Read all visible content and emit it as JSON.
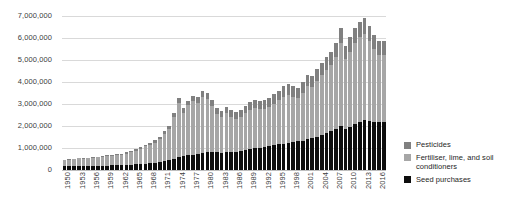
{
  "chart_data": {
    "type": "bar",
    "title": "",
    "subtitle": "",
    "xlabel": "",
    "ylabel": "",
    "stacked": true,
    "grid": true,
    "legend_position": "right",
    "ylim": [
      0,
      7000000
    ],
    "ytick_values": [
      0,
      1000000,
      2000000,
      3000000,
      4000000,
      5000000,
      6000000,
      7000000
    ],
    "ytick_labels": [
      "0",
      "1,000,000",
      "2,000,000",
      "3,000,000",
      "4,000,000",
      "5,000,000",
      "6,000,000",
      "7,000,000"
    ],
    "categories": [
      "1950",
      "1951",
      "1952",
      "1953",
      "1954",
      "1955",
      "1956",
      "1957",
      "1958",
      "1959",
      "1960",
      "1961",
      "1962",
      "1963",
      "1964",
      "1965",
      "1966",
      "1967",
      "1968",
      "1969",
      "1970",
      "1971",
      "1972",
      "1973",
      "1974",
      "1975",
      "1976",
      "1977",
      "1978",
      "1979",
      "1980",
      "1981",
      "1982",
      "1983",
      "1984",
      "1985",
      "1986",
      "1987",
      "1988",
      "1989",
      "1990",
      "1991",
      "1992",
      "1993",
      "1994",
      "1995",
      "1996",
      "1997",
      "1998",
      "1999",
      "2000",
      "2001",
      "2002",
      "2003",
      "2004",
      "2005",
      "2006",
      "2007",
      "2008",
      "2009",
      "2010",
      "2011",
      "2012",
      "2013",
      "2014",
      "2015",
      "2016",
      "2017"
    ],
    "xtick_labels": [
      "1950",
      "1953",
      "1956",
      "1959",
      "1962",
      "1965",
      "1968",
      "1971",
      "1974",
      "1977",
      "1980",
      "1983",
      "1986",
      "1989",
      "1992",
      "1995",
      "1998",
      "2001",
      "2004",
      "2007",
      "2010",
      "2013",
      "2016"
    ],
    "xtick_step": 3,
    "series": [
      {
        "name": "Seed purchases",
        "color": "#0d0d0d",
        "values": [
          160000,
          170000,
          180000,
          185000,
          180000,
          185000,
          190000,
          195000,
          200000,
          205000,
          210000,
          215000,
          225000,
          230000,
          240000,
          255000,
          270000,
          290000,
          310000,
          330000,
          360000,
          400000,
          450000,
          520000,
          600000,
          640000,
          660000,
          690000,
          720000,
          760000,
          800000,
          820000,
          800000,
          790000,
          800000,
          820000,
          840000,
          860000,
          900000,
          940000,
          980000,
          1000000,
          1040000,
          1080000,
          1120000,
          1160000,
          1200000,
          1240000,
          1280000,
          1300000,
          1340000,
          1400000,
          1460000,
          1520000,
          1600000,
          1680000,
          1760000,
          1860000,
          1980000,
          1880000,
          1960000,
          2080000,
          2200000,
          2280000,
          2240000,
          2180000,
          2160000,
          2200000
        ]
      },
      {
        "name": "Fertiliser, lime, and soil conditioners",
        "color": "#a6a6a6",
        "values": [
          280000,
          300000,
          320000,
          340000,
          330000,
          350000,
          370000,
          380000,
          400000,
          420000,
          440000,
          460000,
          480000,
          520000,
          560000,
          620000,
          700000,
          780000,
          850000,
          920000,
          1040000,
          1240000,
          1420000,
          1900000,
          2460000,
          1960000,
          2280000,
          2460000,
          2340000,
          2560000,
          2420000,
          2080000,
          1740000,
          1640000,
          1780000,
          1600000,
          1500000,
          1560000,
          1680000,
          1780000,
          1820000,
          1760000,
          1740000,
          1800000,
          1900000,
          2000000,
          2140000,
          2180000,
          2060000,
          1980000,
          2180000,
          2400000,
          2300000,
          2520000,
          2720000,
          2880000,
          3000000,
          3280000,
          3780000,
          3160000,
          3420000,
          3680000,
          3840000,
          3900000,
          3620000,
          3300000,
          3080000,
          3020000
        ]
      },
      {
        "name": "Pesticides",
        "color": "#808080",
        "values": [
          20000,
          22000,
          24000,
          26000,
          26000,
          28000,
          30000,
          32000,
          34000,
          36000,
          38000,
          42000,
          46000,
          50000,
          56000,
          62000,
          70000,
          80000,
          90000,
          100000,
          115000,
          130000,
          150000,
          170000,
          200000,
          210000,
          220000,
          230000,
          240000,
          260000,
          280000,
          290000,
          280000,
          270000,
          280000,
          290000,
          300000,
          310000,
          330000,
          350000,
          370000,
          380000,
          390000,
          400000,
          420000,
          440000,
          460000,
          480000,
          480000,
          470000,
          490000,
          510000,
          520000,
          540000,
          560000,
          580000,
          600000,
          630000,
          680000,
          620000,
          650000,
          680000,
          700000,
          720000,
          700000,
          660000,
          640000,
          640000
        ]
      }
    ],
    "legend_entries": [
      {
        "label": "Pesticides",
        "color": "#808080"
      },
      {
        "label": "Fertiliser, lime, and soil conditioners",
        "color": "#a6a6a6"
      },
      {
        "label": "Seed purchases",
        "color": "#0d0d0d"
      }
    ]
  }
}
